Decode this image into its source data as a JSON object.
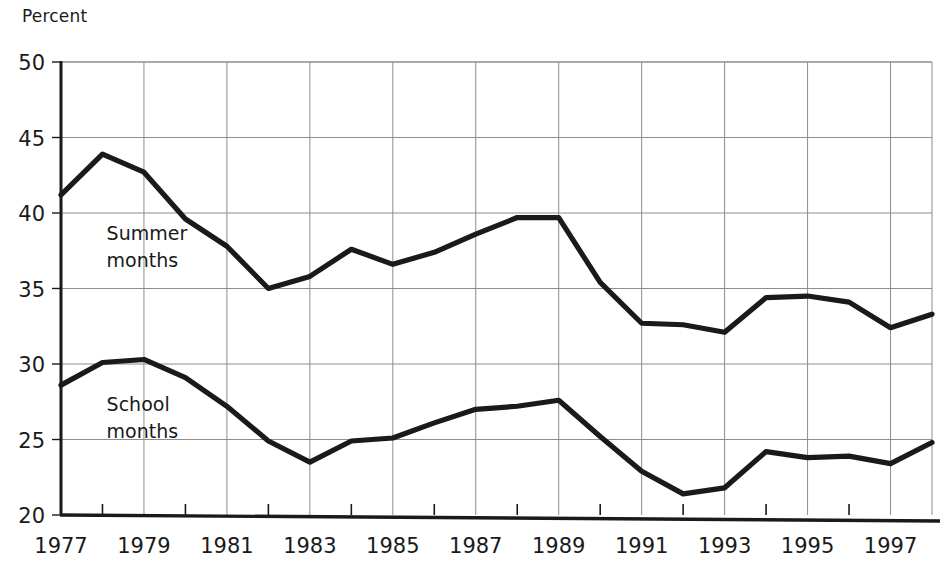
{
  "chart_data": {
    "type": "line",
    "title": "",
    "xlabel": "",
    "ylabel": "Percent",
    "ylim": [
      20,
      50
    ],
    "xlim": [
      1977,
      1998
    ],
    "grid": true,
    "legend_position": "inline-annotation",
    "ytick_labels": [
      "50",
      "45",
      "40",
      "35",
      "30",
      "25",
      "20"
    ],
    "ytick_values": [
      50,
      45,
      40,
      35,
      30,
      25,
      20
    ],
    "xtick_labels": [
      "1977",
      "1979",
      "1981",
      "1983",
      "1985",
      "1987",
      "1989",
      "1991",
      "1993",
      "1995",
      "1997"
    ],
    "xtick_values": [
      1977,
      1979,
      1981,
      1983,
      1985,
      1987,
      1989,
      1991,
      1993,
      1995,
      1997
    ],
    "x": [
      1977,
      1978,
      1979,
      1980,
      1981,
      1982,
      1983,
      1984,
      1985,
      1986,
      1987,
      1988,
      1989,
      1990,
      1991,
      1992,
      1993,
      1994,
      1995,
      1996,
      1997,
      1998
    ],
    "series": [
      {
        "name": "Summer months",
        "label_line1": "Summer",
        "label_line2": "months",
        "color": "#1a1a1a",
        "values": [
          41.2,
          43.9,
          42.7,
          39.6,
          37.8,
          35.0,
          35.8,
          37.6,
          36.6,
          37.4,
          38.6,
          39.7,
          39.7,
          35.4,
          32.7,
          32.6,
          32.1,
          34.4,
          34.5,
          34.1,
          32.4,
          33.3
        ]
      },
      {
        "name": "School months",
        "label_line1": "School",
        "label_line2": "months",
        "color": "#1a1a1a",
        "values": [
          28.6,
          30.1,
          30.3,
          29.1,
          27.2,
          24.9,
          23.5,
          24.9,
          25.1,
          26.1,
          27.0,
          27.2,
          27.6,
          25.2,
          22.9,
          21.4,
          21.8,
          24.2,
          23.8,
          23.9,
          23.4,
          24.8
        ]
      }
    ],
    "annotations": [
      {
        "text": "Summer months",
        "x": 1978.1,
        "y": 38.2
      },
      {
        "text": "School months",
        "x": 1978.1,
        "y": 26.9
      }
    ]
  },
  "geometry": {
    "plot_left": 61,
    "plot_right": 932,
    "plot_top": 62,
    "plot_bottom": 515
  }
}
